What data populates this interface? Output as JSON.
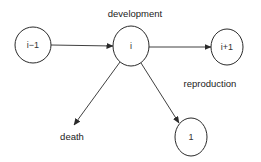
{
  "diagram": {
    "type": "state-transition",
    "colors": {
      "stroke": "#2a2a2a",
      "text": "#333333",
      "background": "#ffffff"
    },
    "nodes": [
      {
        "id": "prev",
        "label": "i−1",
        "cx": 33,
        "cy": 45,
        "rx": 18,
        "ry": 18
      },
      {
        "id": "curr",
        "label": "i",
        "cx": 131,
        "cy": 46,
        "rx": 18,
        "ry": 20
      },
      {
        "id": "next",
        "label": "i+1",
        "cx": 227,
        "cy": 47,
        "rx": 16,
        "ry": 18
      },
      {
        "id": "offspring",
        "label": "1",
        "cx": 191,
        "cy": 137,
        "rx": 16,
        "ry": 19
      }
    ],
    "edges": [
      {
        "from": "prev",
        "to": "curr",
        "label": "",
        "x1": 51,
        "y1": 45,
        "x2": 113,
        "y2": 46
      },
      {
        "from": "curr",
        "to": "next",
        "label": "development",
        "x1": 149,
        "y1": 47,
        "x2": 211,
        "y2": 47
      },
      {
        "from": "curr",
        "to": "death",
        "label": "death",
        "x1": 120,
        "y1": 62,
        "x2": 74,
        "y2": 125
      },
      {
        "from": "curr",
        "to": "offspring",
        "label": "reproduction",
        "x1": 141,
        "y1": 63,
        "x2": 179,
        "y2": 124
      }
    ],
    "labels": {
      "development": {
        "text": "development",
        "x": 135,
        "y": 13
      },
      "reproduction": {
        "text": "reproduction",
        "x": 210,
        "y": 83
      },
      "death": {
        "text": "death",
        "x": 72,
        "y": 136
      }
    }
  }
}
